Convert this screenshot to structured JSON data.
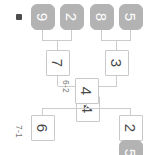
{
  "diagram": {
    "kind": "tournament-bracket",
    "orientation": "rotated-90-clockwise",
    "colors": {
      "open_slot_border": "#c9c9c9",
      "open_slot_text": "#4a4a4a",
      "filled_slot_fill": "#b3b3b3",
      "filled_slot_text": "#ffffff",
      "connector_line": "#cccccc",
      "score_text": "#777777",
      "marker": "#4d4d4d",
      "background": "#ffffff"
    }
  },
  "slots": {
    "top_partial": "5",
    "round1": [
      {
        "label": "2",
        "style": "open"
      },
      {
        "label": "6",
        "style": "open"
      },
      {
        "label": "3",
        "style": "open"
      },
      {
        "label": "7",
        "style": "open"
      }
    ],
    "seeds": [
      {
        "label": "5",
        "style": "filled"
      },
      {
        "label": "8",
        "style": "filled"
      },
      {
        "label": "2",
        "style": "filled"
      },
      {
        "label": "9",
        "style": "filled"
      }
    ],
    "round2": [
      {
        "label": "4",
        "style": "open"
      }
    ],
    "final_partial": {
      "label": "4",
      "style": "open"
    }
  },
  "scores": {
    "match_upper": "6-2",
    "match_lower": "7-1"
  },
  "marker": {
    "name": "bracket-marker",
    "label": ""
  }
}
